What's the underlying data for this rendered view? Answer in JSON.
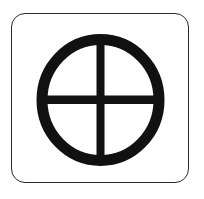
{
  "symbol": {
    "name": "sun-cross-icon",
    "description": "Circle with an inscribed cross inside a rounded-square frame",
    "stroke_color": "#111111",
    "frame_color": "#2a2a2a",
    "background_color": "#ffffff"
  }
}
